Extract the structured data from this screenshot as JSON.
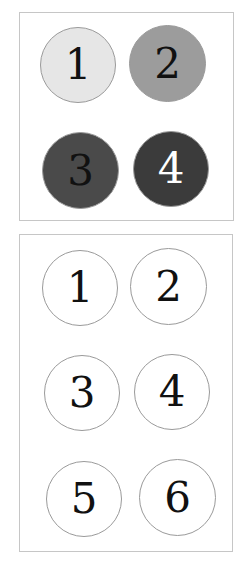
{
  "panels": [
    {
      "id": "top",
      "box": {
        "left": 19,
        "top": 12,
        "width": 215,
        "height": 209
      },
      "circles": [
        {
          "label": "1",
          "fill": "#e6e6e6",
          "text_color": "#111111",
          "left": 40,
          "top": 27,
          "size": 76
        },
        {
          "label": "2",
          "fill": "#9c9c9c",
          "text_color": "#111111",
          "left": 129,
          "top": 25,
          "size": 77
        },
        {
          "label": "3",
          "fill": "#4a4a4a",
          "text_color": "#111111",
          "left": 42,
          "top": 132,
          "size": 77
        },
        {
          "label": "4",
          "fill": "#3b3b3b",
          "text_color": "#ffffff",
          "left": 133,
          "top": 131,
          "size": 76
        }
      ]
    },
    {
      "id": "bottom",
      "box": {
        "left": 19,
        "top": 234,
        "width": 214,
        "height": 318
      },
      "circles": [
        {
          "label": "1",
          "fill": "#ffffff",
          "text_color": "#111111",
          "left": 42,
          "top": 250,
          "size": 76
        },
        {
          "label": "2",
          "fill": "#ffffff",
          "text_color": "#111111",
          "left": 130,
          "top": 248,
          "size": 77
        },
        {
          "label": "3",
          "fill": "#ffffff",
          "text_color": "#111111",
          "left": 44,
          "top": 355,
          "size": 76
        },
        {
          "label": "4",
          "fill": "#ffffff",
          "text_color": "#111111",
          "left": 134,
          "top": 354,
          "size": 76
        },
        {
          "label": "5",
          "fill": "#ffffff",
          "text_color": "#111111",
          "left": 46,
          "top": 461,
          "size": 76
        },
        {
          "label": "6",
          "fill": "#ffffff",
          "text_color": "#111111",
          "left": 139,
          "top": 459,
          "size": 77
        }
      ]
    }
  ]
}
